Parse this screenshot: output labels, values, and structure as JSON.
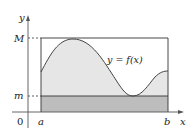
{
  "diagram": {
    "type": "function-bounds",
    "axes": {
      "x_label": "x",
      "y_label": "y",
      "origin_label": "0"
    },
    "labels": {
      "upper_bound": "M",
      "lower_bound": "m",
      "left_endpoint": "a",
      "right_endpoint": "b",
      "curve": "y = f(x)"
    },
    "colors": {
      "curve_fill": "#e6e6e6",
      "rect_fill": "#bdbdbd",
      "stroke": "#333333",
      "background": "#ffffff"
    }
  }
}
